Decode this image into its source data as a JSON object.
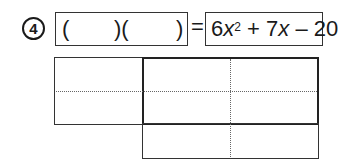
{
  "problem": {
    "number": "4",
    "answer": {
      "left_paren_1": "(",
      "right_paren_1": ")(",
      "right_paren_2": ")"
    },
    "equals": "=",
    "expression": {
      "coef_a": "6",
      "var_a": "x",
      "exp_a": "2",
      "op1": " + ",
      "coef_b": "7",
      "var_b": "x",
      "op2": " – ",
      "constant": "20",
      "full": "6x² + 7x – 20"
    }
  },
  "area_grid": {
    "boxes": [
      {
        "name": "left-cell",
        "x": 54,
        "y": 57,
        "w": 88,
        "h": 67
      },
      {
        "name": "top-right-block",
        "x": 142,
        "y": 57,
        "w": 176,
        "h": 67
      },
      {
        "name": "bottom-block",
        "x": 142,
        "y": 124,
        "w": 176,
        "h": 34
      }
    ],
    "dotted_lines": [
      {
        "orientation": "horizontal",
        "y": 91,
        "x1": 54,
        "x2": 318
      },
      {
        "orientation": "vertical",
        "x": 230,
        "y1": 57,
        "y2": 158
      }
    ]
  }
}
